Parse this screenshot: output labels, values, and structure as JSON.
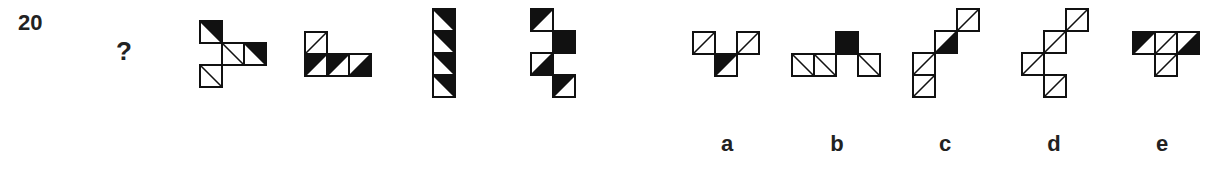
{
  "question": {
    "number": "20",
    "prompt_symbol": "?"
  },
  "cell_size": 22,
  "colors": {
    "stroke": "#111111",
    "fill": "#111111",
    "background": "#ffffff"
  },
  "sequence": [
    {
      "id": "s1",
      "x": 199,
      "y": 20,
      "cells": [
        {
          "c": 0,
          "r": 0,
          "diag": "\\",
          "black": "tr"
        },
        {
          "c": 1,
          "r": 1,
          "diag": "\\",
          "black": "none"
        },
        {
          "c": 2,
          "r": 1,
          "diag": "\\",
          "black": "tr"
        },
        {
          "c": 0,
          "r": 2,
          "diag": "\\",
          "black": "none"
        }
      ]
    },
    {
      "id": "s2",
      "x": 304,
      "y": 31,
      "cells": [
        {
          "c": 0,
          "r": 0,
          "diag": "/",
          "black": "none"
        },
        {
          "c": 0,
          "r": 1,
          "diag": "/",
          "black": "tl"
        },
        {
          "c": 1,
          "r": 1,
          "diag": "/",
          "black": "tl"
        },
        {
          "c": 2,
          "r": 1,
          "diag": "/",
          "black": "br"
        }
      ]
    },
    {
      "id": "s3",
      "x": 432,
      "y": 8,
      "cells": [
        {
          "c": 0,
          "r": 0,
          "diag": "\\",
          "black": "tr"
        },
        {
          "c": 0,
          "r": 1,
          "diag": "\\",
          "black": "tr"
        },
        {
          "c": 0,
          "r": 2,
          "diag": "\\",
          "black": "tr"
        },
        {
          "c": 0,
          "r": 3,
          "diag": "\\",
          "black": "tr"
        }
      ]
    },
    {
      "id": "s4",
      "x": 530,
      "y": 8,
      "cells": [
        {
          "c": 0,
          "r": 0,
          "diag": "/",
          "black": "tl"
        },
        {
          "c": 1,
          "r": 1,
          "diag": "none",
          "black": "full"
        },
        {
          "c": 0,
          "r": 2,
          "diag": "/",
          "black": "br"
        },
        {
          "c": 1,
          "r": 3,
          "diag": "/",
          "black": "tl"
        }
      ]
    }
  ],
  "options": [
    {
      "label": "a",
      "x": 692,
      "y": 31,
      "label_x": 712,
      "cells": [
        {
          "c": 0,
          "r": 0,
          "diag": "/",
          "black": "none"
        },
        {
          "c": 1,
          "r": 1,
          "diag": "/",
          "black": "tl"
        },
        {
          "c": 2,
          "r": 0,
          "diag": "/",
          "black": "none"
        }
      ]
    },
    {
      "label": "b",
      "x": 791,
      "y": 31,
      "label_x": 822,
      "cells": [
        {
          "c": 0,
          "r": 1,
          "diag": "\\",
          "black": "none"
        },
        {
          "c": 1,
          "r": 1,
          "diag": "\\",
          "black": "none"
        },
        {
          "c": 2,
          "r": 0,
          "diag": "none",
          "black": "full"
        },
        {
          "c": 3,
          "r": 1,
          "diag": "\\",
          "black": "none"
        }
      ]
    },
    {
      "label": "c",
      "x": 912,
      "y": 8,
      "label_x": 930,
      "cells": [
        {
          "c": 2,
          "r": 0,
          "diag": "/",
          "black": "none"
        },
        {
          "c": 1,
          "r": 1,
          "diag": "/",
          "black": "br"
        },
        {
          "c": 0,
          "r": 2,
          "diag": "/",
          "black": "none"
        },
        {
          "c": 0,
          "r": 3,
          "diag": "/",
          "black": "none"
        }
      ]
    },
    {
      "label": "d",
      "x": 1021,
      "y": 8,
      "label_x": 1039,
      "cells": [
        {
          "c": 2,
          "r": 0,
          "diag": "/",
          "black": "none"
        },
        {
          "c": 1,
          "r": 1,
          "diag": "/",
          "black": "none"
        },
        {
          "c": 0,
          "r": 2,
          "diag": "/",
          "black": "none"
        },
        {
          "c": 1,
          "r": 3,
          "diag": "/",
          "black": "none"
        }
      ]
    },
    {
      "label": "e",
      "x": 1132,
      "y": 31,
      "label_x": 1147,
      "cells": [
        {
          "c": 0,
          "r": 0,
          "diag": "/",
          "black": "tl"
        },
        {
          "c": 1,
          "r": 0,
          "diag": "/",
          "black": "none"
        },
        {
          "c": 2,
          "r": 0,
          "diag": "/",
          "black": "br"
        },
        {
          "c": 1,
          "r": 1,
          "diag": "/",
          "black": "none"
        }
      ]
    }
  ]
}
